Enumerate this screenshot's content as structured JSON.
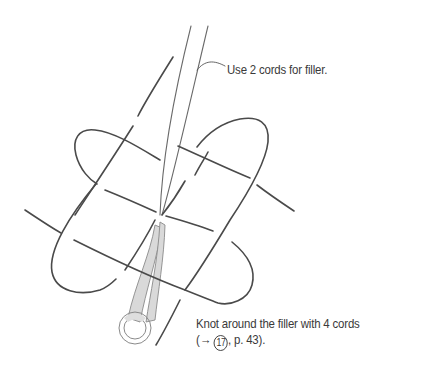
{
  "diagram": {
    "annotations": {
      "filler": {
        "text": "Use 2 cords for filler."
      },
      "knot": {
        "line1": "Knot around the filler with 4 cords",
        "line2_prefix": "(→ ",
        "step_number": "17",
        "line2_suffix": ", p. 43)."
      }
    },
    "elements": {
      "filler_cords": 2,
      "working_cords": 4,
      "ring": "key-ring"
    },
    "colors": {
      "line": "#4a4a4a",
      "shade": "#d9d9d9",
      "background": "#ffffff",
      "text": "#3a3a3a"
    }
  }
}
